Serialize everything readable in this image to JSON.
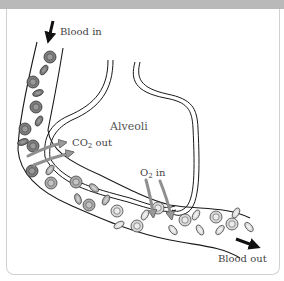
{
  "diagram": {
    "type": "gas-exchange-capillary",
    "labels": {
      "blood_in": "Blood in",
      "blood_out": "Blood out",
      "alveoli": "Alveoli",
      "co2_out_prefix": "CO",
      "co2_out_sub": "2",
      "co2_out_suffix": " out",
      "o2_in_prefix": "O",
      "o2_in_sub": "2",
      "o2_in_suffix": " in"
    },
    "colors": {
      "header_bar": "#b9b9b9",
      "vessel_line": "#1a1a1a",
      "alveolus_line": "#1a1a1a",
      "cell_deoxygenated": "#7a7a7a",
      "cell_oxygenated": "#d4d4d4",
      "exchange_arrow": "#a8a8a8",
      "flow_arrow": "#111111"
    }
  }
}
